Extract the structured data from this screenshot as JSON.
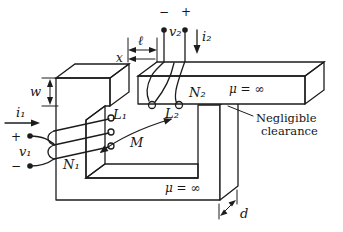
{
  "colors": {
    "ink": "#1c1c1c",
    "paper": "#ffffff",
    "core_texture_base": "#eae8e3"
  },
  "labels": {
    "w": "w",
    "ell": "ℓ",
    "x": "x",
    "d": "d",
    "i1": "i₁",
    "v1": "v₁",
    "plus1": "+",
    "minus1": "−",
    "N1": "N₁",
    "L1": "L₁",
    "M": "M",
    "i2": "i₂",
    "v2": "v₂",
    "plus2": "+",
    "minus2": "−",
    "N2": "N₂",
    "L2": "L₂",
    "mu_top": "μ = ∞",
    "mu_bottom": "μ = ∞"
  },
  "note": {
    "line1": "Negligible",
    "line2": "clearance"
  }
}
